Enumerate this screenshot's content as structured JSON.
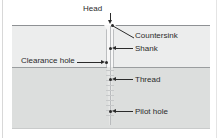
{
  "diagram": {
    "type": "cross-section",
    "materials": [
      {
        "name": "upper-workpiece",
        "fill": "#eceded"
      },
      {
        "name": "lower-workpiece",
        "fill": "#dcdedd"
      }
    ],
    "line_color": "#2b2b2b",
    "callouts": [
      {
        "id": "head",
        "label": "Head",
        "position": "top",
        "pointer": "arrow-down"
      },
      {
        "id": "countersink",
        "label": "Countersink",
        "position": "right",
        "pointer": "diagonal-line"
      },
      {
        "id": "shank",
        "label": "Shank",
        "position": "right",
        "pointer": "arrow-left"
      },
      {
        "id": "clearance-hole",
        "label": "Clearance hole",
        "position": "left",
        "pointer": "arrow-right"
      },
      {
        "id": "thread",
        "label": "Thread",
        "position": "right",
        "pointer": "arrow-left"
      },
      {
        "id": "pilot-hole",
        "label": "Pilot hole",
        "position": "right",
        "pointer": "arrow-left"
      }
    ]
  }
}
